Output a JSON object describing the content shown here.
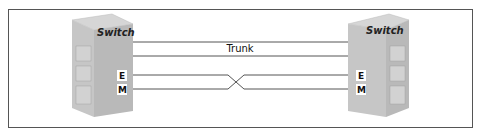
{
  "diagram": {
    "left_switch": {
      "label": "Switch",
      "ports": [
        "E",
        "M"
      ]
    },
    "right_switch": {
      "label": "Switch",
      "ports": [
        "E",
        "M"
      ]
    },
    "link_label": "Trunk",
    "links": [
      {
        "from": "left-switch",
        "to": "right-switch",
        "type": "trunk"
      },
      {
        "from": "left-switch",
        "to": "right-switch",
        "type": "trunk"
      },
      {
        "from": "left-switch.E",
        "to": "right-switch.M",
        "type": "crossover"
      },
      {
        "from": "left-switch.M",
        "to": "right-switch.E",
        "type": "crossover"
      }
    ]
  },
  "colors": {
    "line": "#555555",
    "switch_top": "#d4d4d4",
    "switch_front": "#c2c2c2",
    "switch_side": "#b3b3b3"
  }
}
